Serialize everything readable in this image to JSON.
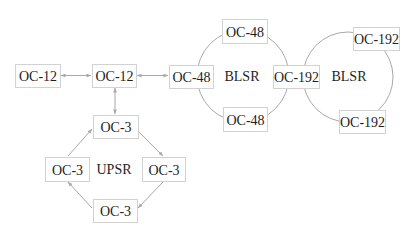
{
  "diagram": {
    "colors": {
      "box_border": "#d2d2d2",
      "edge": "#a8a8a8",
      "text": "#1e1e1e",
      "background": "#ffffff"
    },
    "rings": [
      {
        "id": "blsr1",
        "type": "BLSR",
        "label": "BLSR",
        "cx": 243,
        "cy": 76,
        "r": 46
      },
      {
        "id": "blsr2",
        "type": "BLSR",
        "label": "BLSR",
        "cx": 348,
        "cy": 77,
        "r": 45
      },
      {
        "id": "upsr",
        "type": "UPSR",
        "label": "UPSR"
      }
    ],
    "nodes": [
      {
        "id": "oc12a",
        "label": "OC-12",
        "x": 15,
        "y": 64,
        "w": 45,
        "h": 23
      },
      {
        "id": "oc12b",
        "label": "OC-12",
        "x": 92,
        "y": 64,
        "w": 44,
        "h": 23
      },
      {
        "id": "oc48l",
        "label": "OC-48",
        "x": 169,
        "y": 65,
        "w": 44,
        "h": 23
      },
      {
        "id": "oc48t",
        "label": "OC-48",
        "x": 222,
        "y": 19,
        "w": 45,
        "h": 24
      },
      {
        "id": "oc48b",
        "label": "OC-48",
        "x": 223,
        "y": 107,
        "w": 44,
        "h": 24
      },
      {
        "id": "oc192m",
        "label": "OC-192",
        "x": 273,
        "y": 65,
        "w": 46,
        "h": 23
      },
      {
        "id": "oc192t",
        "label": "OC-192",
        "x": 353,
        "y": 27,
        "w": 46,
        "h": 23
      },
      {
        "id": "oc192b",
        "label": "OC-192",
        "x": 339,
        "y": 110,
        "w": 46,
        "h": 23
      },
      {
        "id": "oc3t",
        "label": "OC-3",
        "x": 93,
        "y": 115,
        "w": 45,
        "h": 23
      },
      {
        "id": "oc3l",
        "label": "OC-3",
        "x": 45,
        "y": 157,
        "w": 44,
        "h": 24
      },
      {
        "id": "oc3r",
        "label": "OC-3",
        "x": 142,
        "y": 157,
        "w": 43,
        "h": 24
      },
      {
        "id": "oc3b",
        "label": "OC-3",
        "x": 93,
        "y": 199,
        "w": 44,
        "h": 23
      }
    ],
    "edges": [
      {
        "from": "oc12a",
        "to": "oc12b",
        "direction": "both"
      },
      {
        "from": "oc12b",
        "to": "oc48l",
        "direction": "both"
      },
      {
        "from": "oc12b",
        "to": "oc3t",
        "direction": "both"
      },
      {
        "from": "oc3t",
        "to": "oc3r",
        "direction": "forward"
      },
      {
        "from": "oc3r",
        "to": "oc3b",
        "direction": "forward"
      },
      {
        "from": "oc3b",
        "to": "oc3l",
        "direction": "forward"
      },
      {
        "from": "oc3l",
        "to": "oc3t",
        "direction": "forward"
      }
    ]
  }
}
